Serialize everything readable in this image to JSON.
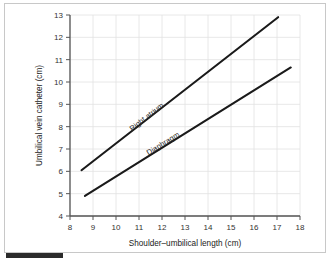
{
  "chart_data": {
    "type": "line",
    "title": "",
    "xlabel": "Shoulder–umbilical length (cm)",
    "ylabel": "Umbilical vein catheter (cm)",
    "xlim": [
      8,
      18
    ],
    "ylim": [
      4,
      13
    ],
    "xticks": [
      8,
      9,
      10,
      11,
      12,
      13,
      14,
      15,
      16,
      17,
      18
    ],
    "yticks": [
      4,
      5,
      6,
      7,
      8,
      9,
      10,
      11,
      12,
      13
    ],
    "xtick_labels": [
      "8",
      "9",
      "10",
      "11",
      "12",
      "13",
      "14",
      "15",
      "16",
      "17",
      "18"
    ],
    "ytick_labels": [
      "4",
      "5",
      "6",
      "7",
      "8",
      "9",
      "10",
      "11",
      "12",
      "13"
    ],
    "grid": true,
    "legend_position": "inline-on-line",
    "line_color": "#1a1a1a",
    "grid_color": "#e2e2e2",
    "axis_color": "#555555",
    "series": [
      {
        "name": "Right atrium",
        "x": [
          8.5,
          17.05
        ],
        "values": [
          6.05,
          12.9
        ],
        "label_x": 11.4,
        "label_y": 8.35
      },
      {
        "name": "Diaphragm",
        "x": [
          8.65,
          17.6
        ],
        "values": [
          4.9,
          10.65
        ],
        "label_x": 12.1,
        "label_y": 7.15
      }
    ]
  },
  "figure": {
    "background_color": "#ffffff",
    "frame_color": "#c8c8c8",
    "marker_bar_color": "#2b2b2b"
  }
}
